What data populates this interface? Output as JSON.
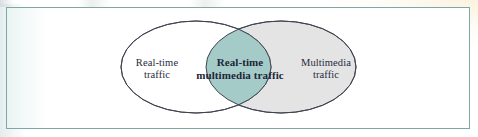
{
  "figure": {
    "type": "venn-diagram",
    "title": "",
    "frame": {
      "border_color": "#7fa8a4",
      "background_color": "#ffffff"
    },
    "sets": [
      {
        "id": "real-time",
        "label_line1": "Real-time",
        "label_line2": "traffic",
        "fill_color": "#ffffff",
        "stroke_color": "#3f4450",
        "position": "left"
      },
      {
        "id": "multimedia",
        "label_line1": "Multimedia",
        "label_line2": "traffic",
        "fill_color": "#e4e4e4",
        "stroke_color": "#3f4450",
        "position": "right"
      }
    ],
    "intersection": {
      "id": "real-time-multimedia",
      "label_line1": "Real-time",
      "label_line2": "multimedia traffic",
      "fill_color": "#a5cbc8",
      "stroke_color": "#3f4450"
    },
    "text_color": "#262b3d"
  }
}
